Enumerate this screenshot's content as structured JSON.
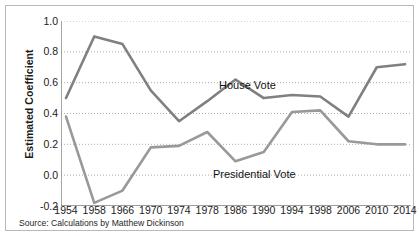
{
  "chart_data": {
    "type": "line",
    "title": "",
    "xlabel": "",
    "ylabel": "Estimated Coefficient",
    "ylim": [
      -0.2,
      1.0
    ],
    "yticks": [
      1.0,
      0.8,
      0.6,
      0.4,
      0.2,
      0.0,
      -0.2
    ],
    "ytick_labels": [
      "1.0",
      "0.8",
      "0.6",
      "0.4",
      "0.2",
      "0.0",
      "-0.2"
    ],
    "grid": true,
    "grid_style": "dotted-horizontal",
    "legend": "inline-annotations",
    "categories": [
      "1954",
      "1958",
      "1966",
      "1970",
      "1974",
      "1978",
      "1986",
      "1990",
      "1994",
      "1998",
      "2006",
      "2010",
      "2014"
    ],
    "x": [
      1954,
      1958,
      1966,
      1970,
      1974,
      1978,
      1986,
      1990,
      1994,
      1998,
      2006,
      2010,
      2014
    ],
    "series": [
      {
        "name": "House Vote",
        "color": "#808080",
        "values": [
          0.5,
          0.9,
          0.85,
          0.55,
          0.35,
          0.48,
          0.62,
          0.5,
          0.52,
          0.51,
          0.38,
          0.7,
          0.72
        ]
      },
      {
        "name": "Presidential Vote",
        "color": "#999999",
        "values": [
          0.38,
          -0.18,
          -0.1,
          0.18,
          0.19,
          0.28,
          0.09,
          0.15,
          0.41,
          0.42,
          0.22,
          0.2,
          0.2
        ]
      }
    ],
    "annotations": [
      {
        "text": "House Vote",
        "x": 1971,
        "y": 0.7
      },
      {
        "text": "Presidential Vote",
        "x": 1970,
        "y": 0.12
      }
    ],
    "source": "Source: Calculations by Matthew Dickinson",
    "colors": {
      "house_line": "#808080",
      "presidential_line": "#999999",
      "axis": "#808080",
      "grid": "#9a9a9a",
      "border": "#b9b9b9",
      "text": "#1b1b1b",
      "background": "#ffffff"
    }
  }
}
